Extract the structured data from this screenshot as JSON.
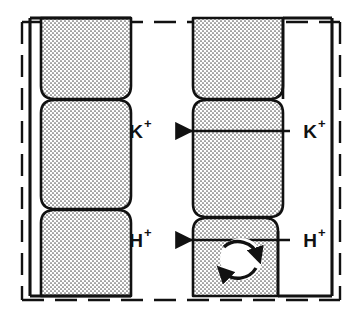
{
  "figure": {
    "background_color": "#ffffff",
    "line_color": "#111111",
    "cell_fill_color": "#e9e9e9",
    "stipple_color": "#4a4a4a"
  },
  "labels": {
    "k_inner": {
      "base": "K",
      "sup": "+"
    },
    "k_outer": {
      "base": "K",
      "sup": "+"
    },
    "h_inner": {
      "base": "H",
      "sup": "+"
    },
    "h_outer": {
      "base": "H",
      "sup": "+"
    }
  },
  "boundaries": {
    "outer_dashed_name": "apoplast-dashed-boundary",
    "left_solid_name": "left-cell-wall",
    "right_solid_name": "right-cell-wall"
  },
  "cells": {
    "left_column": [
      {
        "name": "left-cell-top"
      },
      {
        "name": "left-cell-middle"
      },
      {
        "name": "left-cell-bottom"
      }
    ],
    "right_column": [
      {
        "name": "right-cell-top"
      },
      {
        "name": "right-cell-middle"
      },
      {
        "name": "right-cell-bottom"
      }
    ]
  },
  "arrows": {
    "potassium_flux": {
      "name": "potassium-transport-arrow",
      "direction": "leftward",
      "y": 131
    },
    "proton_flux": {
      "name": "proton-transport-arrow",
      "direction": "leftward",
      "y": 240
    },
    "proton_pump": {
      "name": "proton-pump-cycle-icon",
      "type": "circular-double-arrow",
      "cx": 241,
      "cy": 259,
      "r": 21
    }
  }
}
